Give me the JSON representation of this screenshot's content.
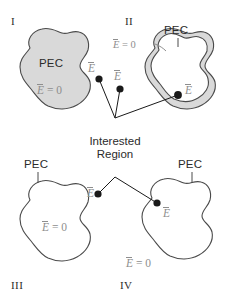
{
  "figure": {
    "background_color": "#ffffff",
    "outline_color": "#4a4a4a",
    "fill_gray": "#d9d9d9",
    "fill_white": "#ffffff",
    "text_dark": "#2b2b2b",
    "text_gray": "#8e8e8e",
    "dot_color": "#1a1a1a",
    "connector_color": "#1a1a1a"
  },
  "center": {
    "label_line1": "Interested",
    "label_line2": "Region"
  },
  "quadrants": [
    {
      "id": "I",
      "numeral": "I",
      "shape": "solid-blob",
      "fill": "gray",
      "pec_label": "PEC",
      "pec_has_leader": false,
      "interior_field": {
        "e": "E",
        "eq": "= 0"
      },
      "exterior_field": {
        "e": "E"
      },
      "dot_count": 1
    },
    {
      "id": "II",
      "numeral": "II",
      "shape": "shell-blob",
      "fill": "gray-shell",
      "pec_label": "PEC",
      "pec_has_leader": true,
      "shell_field": {
        "e": "E",
        "eq": "= 0"
      },
      "interior_field": {
        "e": "E"
      },
      "dot_count": 1
    },
    {
      "id": "III",
      "numeral": "III",
      "shape": "open-blob",
      "fill": "white",
      "pec_label": "PEC",
      "pec_has_leader": true,
      "interior_field": {
        "e": "E",
        "eq": "= 0"
      },
      "exterior_field": {
        "e": "E"
      },
      "dot_count": 0
    },
    {
      "id": "IV",
      "numeral": "IV",
      "shape": "open-blob",
      "fill": "white",
      "pec_label": "PEC",
      "pec_has_leader": true,
      "interior_field": {
        "e": "E"
      },
      "exterior_field": {
        "e": "E",
        "eq": "= 0"
      },
      "dot_count": 1
    }
  ],
  "field_symbols": {
    "e_bar": "E",
    "e_zero_rhs": "= 0"
  }
}
